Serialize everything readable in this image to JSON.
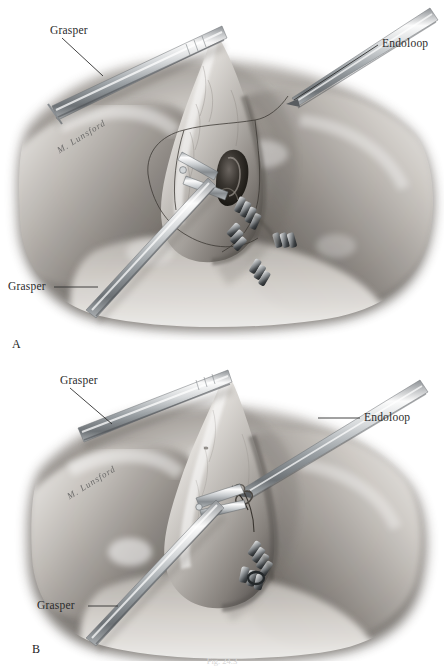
{
  "figure": {
    "type": "medical-illustration",
    "technique": "grayscale-pencil-rendering",
    "background_color": "#ffffff",
    "ink_color": "#2b2b2b",
    "panel_count": 2
  },
  "panel_a": {
    "letter": "A",
    "labels": [
      {
        "text": "Grasper",
        "role": "instrument-callout",
        "position": "upper-left"
      },
      {
        "text": "Endoloop",
        "role": "instrument-callout",
        "position": "upper-right"
      },
      {
        "text": "Grasper",
        "role": "instrument-callout",
        "position": "lower-left"
      }
    ],
    "signature": "M. Lunsford",
    "depicted": [
      "gallbladder retracted upward",
      "open cystic duct with grasper jaws",
      "surgical clips on cystic artery",
      "endoloop suture thread encircling duct",
      "liver bed and omental tissue"
    ]
  },
  "panel_b": {
    "letter": "B",
    "labels": [
      {
        "text": "Grasper",
        "role": "instrument-callout",
        "position": "upper-left"
      },
      {
        "text": "Endoloop",
        "role": "instrument-callout",
        "position": "right"
      },
      {
        "text": "Grasper",
        "role": "instrument-callout",
        "position": "lower-left"
      }
    ],
    "signature": "M. Lunsford",
    "depicted": [
      "gallbladder retracted upward",
      "endoloop tightened around cystic duct stump",
      "surgical clips below the loop",
      "liver bed and omental tissue"
    ]
  },
  "caption": {
    "text": "Fig. 24.3",
    "visible": "partially-cropped-at-bottom-edge"
  },
  "colors": {
    "paper": "#ffffff",
    "ink": "#2b2b2b",
    "tissue_light": "#d7d3cf",
    "tissue_mid": "#a8a39e",
    "tissue_dark": "#6d6863",
    "shadow": "#4a4641",
    "metal_light": "#f2f2f2",
    "metal_mid": "#b9bcbe",
    "metal_dark": "#6a6e72"
  }
}
